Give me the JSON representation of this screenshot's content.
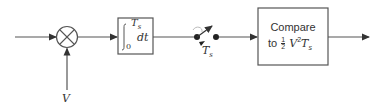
{
  "diagram": {
    "type": "block-diagram",
    "title": "",
    "blocks": [
      {
        "id": "multiplier",
        "kind": "multiplier",
        "symbol": "×"
      },
      {
        "id": "integrator",
        "kind": "integrator",
        "upper_limit": "T",
        "upper_sub": "s",
        "lower_limit": "0",
        "integrand": "dt"
      },
      {
        "id": "sampler",
        "kind": "switch",
        "label": "T",
        "label_sub": "s"
      },
      {
        "id": "comparator",
        "kind": "compare",
        "line1": "Compare",
        "line2_prefix": "to",
        "frac_num": "1",
        "frac_den": "2",
        "expr_var": "V",
        "expr_exp": "2",
        "expr_t": "T",
        "expr_t_sub": "s"
      }
    ],
    "inputs": [
      {
        "id": "signal-in",
        "label": ""
      },
      {
        "id": "reference-in",
        "label": "V"
      }
    ],
    "output": {
      "label": ""
    }
  },
  "colors": {
    "line": "#555555",
    "text": "#333333",
    "background": "#ffffff"
  }
}
